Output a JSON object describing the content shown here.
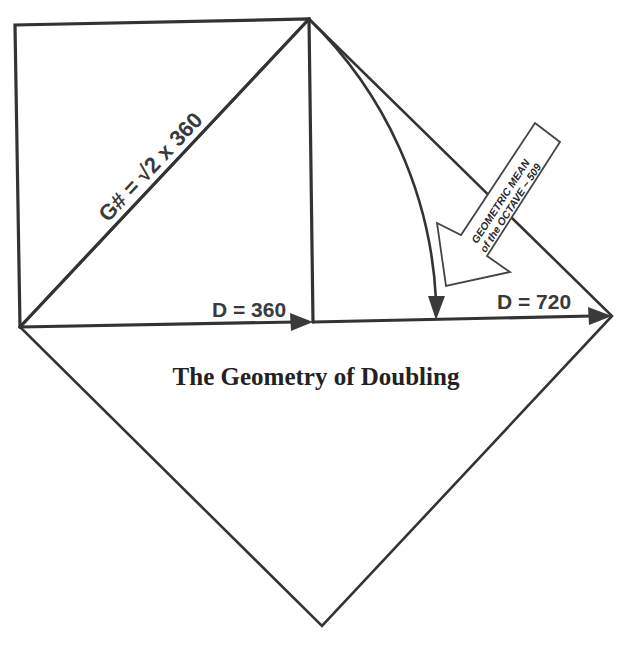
{
  "diagram": {
    "title": "The Geometry of Doubling",
    "labels": {
      "diagonal": "G# = √2  x 360",
      "d_small": "D = 360",
      "d_large": "D = 720"
    },
    "callout": {
      "line1": "GEOMETRIC MEAN",
      "line2": "of the OCTAVE ~ 509"
    },
    "colors": {
      "stroke": "#333333",
      "background": "#ffffff",
      "text": "#3a3a3a"
    }
  }
}
